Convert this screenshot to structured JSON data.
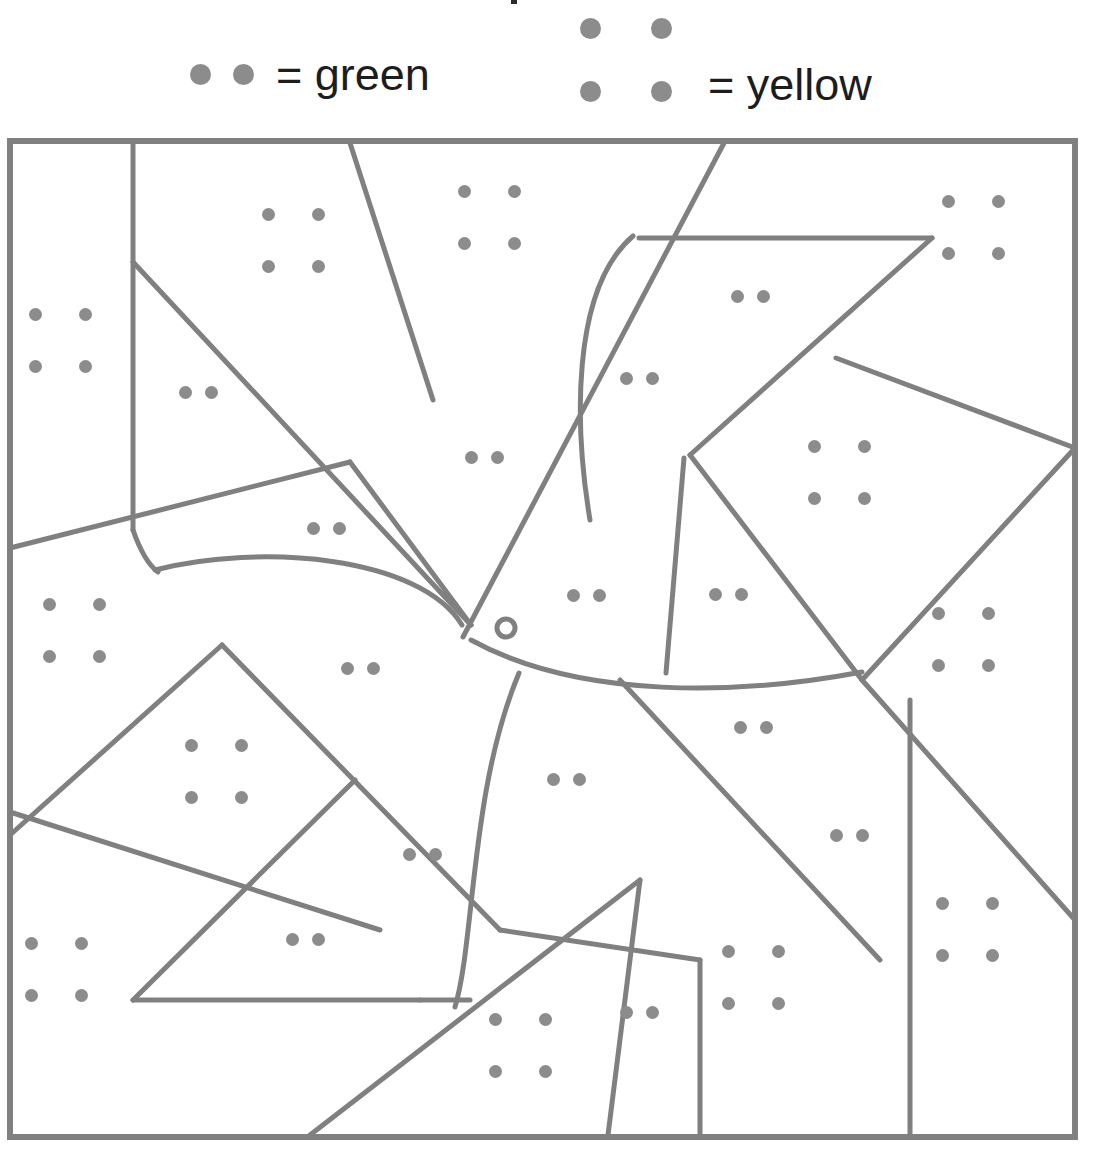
{
  "legend": {
    "green": {
      "dot_count": 2,
      "equals": "=",
      "label": "green",
      "text": "= green",
      "color_name": "green"
    },
    "yellow": {
      "dot_count": 4,
      "equals": "=",
      "label": "yellow",
      "text": "= yellow",
      "color_name": "yellow"
    },
    "dot_color": "#8c8c8c",
    "text_color": "#1d1d1d"
  },
  "board": {
    "frame": {
      "x": 10,
      "y": 141,
      "width": 1065,
      "height": 996
    },
    "line_color": "#808080",
    "line_width": 5,
    "border_width": 6,
    "dot_color": "#8c8c8c",
    "dot_diameter": 13
  },
  "regions": [
    {
      "id": "r01",
      "dots": 4,
      "color": "green",
      "dot_positions": [
        [
          35,
          314
        ],
        [
          85,
          314
        ],
        [
          35,
          366
        ],
        [
          85,
          366
        ]
      ]
    },
    {
      "id": "r02",
      "dots": 4,
      "color": "yellow",
      "dot_positions": [
        [
          268,
          214
        ],
        [
          318,
          214
        ],
        [
          268,
          266
        ],
        [
          318,
          266
        ]
      ]
    },
    {
      "id": "r03",
      "dots": 2,
      "color": "green",
      "dot_positions": [
        [
          185,
          392
        ],
        [
          211,
          392
        ]
      ]
    },
    {
      "id": "r04",
      "dots": 4,
      "color": "yellow",
      "dot_positions": [
        [
          464,
          191
        ],
        [
          514,
          191
        ],
        [
          464,
          243
        ],
        [
          514,
          243
        ]
      ]
    },
    {
      "id": "r05",
      "dots": 2,
      "color": "green",
      "dot_positions": [
        [
          471,
          457
        ],
        [
          497,
          457
        ]
      ]
    },
    {
      "id": "r06",
      "dots": 2,
      "color": "green",
      "dot_positions": [
        [
          313,
          528
        ],
        [
          339,
          528
        ]
      ]
    },
    {
      "id": "r07",
      "dots": 2,
      "color": "green",
      "dot_positions": [
        [
          737,
          296
        ],
        [
          763,
          296
        ]
      ]
    },
    {
      "id": "r08",
      "dots": 2,
      "color": "green",
      "dot_positions": [
        [
          626,
          378
        ],
        [
          652,
          378
        ]
      ]
    },
    {
      "id": "r09",
      "dots": 4,
      "color": "yellow",
      "dot_positions": [
        [
          948,
          201
        ],
        [
          998,
          201
        ],
        [
          948,
          253
        ],
        [
          998,
          253
        ]
      ]
    },
    {
      "id": "r10",
      "dots": 4,
      "color": "yellow",
      "dot_positions": [
        [
          814,
          446
        ],
        [
          864,
          446
        ],
        [
          814,
          498
        ],
        [
          864,
          498
        ]
      ]
    },
    {
      "id": "r11",
      "dots": 4,
      "color": "yellow",
      "dot_positions": [
        [
          938,
          613
        ],
        [
          988,
          613
        ],
        [
          938,
          665
        ],
        [
          988,
          665
        ]
      ]
    },
    {
      "id": "r12",
      "dots": 4,
      "color": "yellow",
      "dot_positions": [
        [
          49,
          604
        ],
        [
          99,
          604
        ],
        [
          49,
          656
        ],
        [
          99,
          656
        ]
      ]
    },
    {
      "id": "r13",
      "dots": 2,
      "color": "green",
      "dot_positions": [
        [
          573,
          595
        ],
        [
          599,
          595
        ]
      ]
    },
    {
      "id": "r14",
      "dots": 2,
      "color": "green",
      "dot_positions": [
        [
          715,
          594
        ],
        [
          741,
          594
        ]
      ]
    },
    {
      "id": "r15",
      "dots": 2,
      "color": "green",
      "dot_positions": [
        [
          347,
          668
        ],
        [
          373,
          668
        ]
      ]
    },
    {
      "id": "r16",
      "dots": 4,
      "color": "yellow",
      "dot_positions": [
        [
          191,
          745
        ],
        [
          241,
          745
        ],
        [
          191,
          797
        ],
        [
          241,
          797
        ]
      ]
    },
    {
      "id": "r17",
      "dots": 2,
      "color": "green",
      "dot_positions": [
        [
          740,
          727
        ],
        [
          766,
          727
        ]
      ]
    },
    {
      "id": "r18",
      "dots": 2,
      "color": "green",
      "dot_positions": [
        [
          553,
          779
        ],
        [
          579,
          779
        ]
      ]
    },
    {
      "id": "r19",
      "dots": 2,
      "color": "green",
      "dot_positions": [
        [
          409,
          854
        ],
        [
          435,
          854
        ]
      ]
    },
    {
      "id": "r20",
      "dots": 2,
      "color": "green",
      "dot_positions": [
        [
          836,
          835
        ],
        [
          862,
          835
        ]
      ]
    },
    {
      "id": "r21",
      "dots": 4,
      "color": "yellow",
      "dot_positions": [
        [
          31,
          943
        ],
        [
          81,
          943
        ],
        [
          31,
          995
        ],
        [
          81,
          995
        ]
      ]
    },
    {
      "id": "r22",
      "dots": 2,
      "color": "green",
      "dot_positions": [
        [
          292,
          939
        ],
        [
          318,
          939
        ]
      ]
    },
    {
      "id": "r23",
      "dots": 4,
      "color": "yellow",
      "dot_positions": [
        [
          942,
          903
        ],
        [
          992,
          903
        ],
        [
          942,
          955
        ],
        [
          992,
          955
        ]
      ]
    },
    {
      "id": "r24",
      "dots": 4,
      "color": "yellow",
      "dot_positions": [
        [
          728,
          951
        ],
        [
          778,
          951
        ],
        [
          728,
          1003
        ],
        [
          778,
          1003
        ]
      ]
    },
    {
      "id": "r25",
      "dots": 4,
      "color": "yellow",
      "dot_positions": [
        [
          495,
          1019
        ],
        [
          545,
          1019
        ],
        [
          495,
          1071
        ],
        [
          545,
          1071
        ]
      ]
    },
    {
      "id": "r26",
      "dots": 2,
      "color": "green",
      "dot_positions": [
        [
          626,
          1012
        ],
        [
          652,
          1012
        ]
      ]
    }
  ],
  "lines": {
    "straight": [
      {
        "name": "left-vertical-upper",
        "points": "133,143 133,530"
      },
      {
        "name": "diagonal-tl-to-center",
        "points": "133,262 471,625"
      },
      {
        "name": "top-to-midleft-diagonal",
        "points": "350,143 433,400"
      },
      {
        "name": "left-band-diagonal",
        "points": "10,548 350,462"
      },
      {
        "name": "center-fan-upleft",
        "points": "350,462 471,625"
      },
      {
        "name": "long-main-diagonal",
        "points": "724,143 463,637"
      },
      {
        "name": "upper-right-chevron-down",
        "points": "639,238 932,238"
      },
      {
        "name": "upper-right-chevron-back",
        "points": "932,238 690,455"
      },
      {
        "name": "right-upper-edge",
        "points": "836,358 1075,448"
      },
      {
        "name": "right-diamond-top",
        "points": "1075,448 862,680"
      },
      {
        "name": "right-diamond-bottom",
        "points": "690,455 862,680"
      },
      {
        "name": "center-vertical-short",
        "points": "684,458 666,673"
      },
      {
        "name": "mid-right-fan",
        "points": "862,680 1075,920"
      },
      {
        "name": "right-vertical-lower",
        "points": "910,700 910,1135"
      },
      {
        "name": "left-lower-diagonal-a",
        "points": "222,645 500,930"
      },
      {
        "name": "left-lower-diagonal-b",
        "points": "222,645 10,835"
      },
      {
        "name": "left-lower-diagonal-c",
        "points": "10,812 380,930"
      },
      {
        "name": "diamond-left-down",
        "points": "133,1000 420,1000"
      },
      {
        "name": "diamond-left-up",
        "points": "133,1000 355,780"
      },
      {
        "name": "big-bottom-diagonal",
        "points": "310,1135 640,880"
      },
      {
        "name": "tail-diagonal-right",
        "points": "620,680 880,960"
      },
      {
        "name": "bottom-sliver-a",
        "points": "608,1135 640,880"
      },
      {
        "name": "bottom-sliver-b",
        "points": "700,1135 700,960"
      },
      {
        "name": "mid-lower-fan",
        "points": "500,930 700,960"
      },
      {
        "name": "lower-left-to-tail",
        "points": "420,1000 470,1000"
      }
    ],
    "curved": [
      {
        "name": "bird-back-curve",
        "d": "M 155,570 C 260,543 420,556 462,625"
      },
      {
        "name": "bird-neck-curve",
        "d": "M 633,236 C 570,290 575,430 590,520"
      },
      {
        "name": "bird-belly-curve",
        "d": "M 471,640 C 580,700 740,695 862,672"
      },
      {
        "name": "bird-tail-curve",
        "d": "M 519,673 C 470,790 475,940 455,1007"
      },
      {
        "name": "wing-under-curve",
        "d": "M 133,530 C 142,556 150,566 158,572"
      }
    ],
    "eye": {
      "cx": 506,
      "cy": 628,
      "r_outer": 9,
      "r_inner": 3
    }
  }
}
